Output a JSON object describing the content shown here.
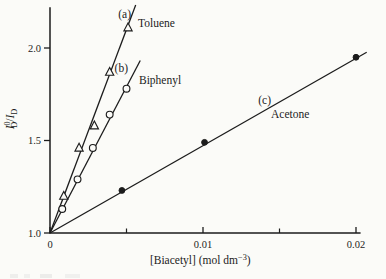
{
  "page": {
    "background": "#fbfbf8",
    "ink": "#1c1c1c"
  },
  "chart_data": {
    "type": "scatter",
    "title": "",
    "xlabel": "[Biacetyl] (mol dm⁻³)",
    "ylabel": "I⁰D/ID",
    "xlabel_parts": [
      {
        "t": "[Biacetyl] (mol dm"
      },
      {
        "t": "−3",
        "pos": "sup"
      },
      {
        "t": ")"
      }
    ],
    "ylabel_parts": [
      {
        "t": "I",
        "italic": true
      },
      {
        "t": "0",
        "pos": "sup"
      },
      {
        "t": "D",
        "pos": "sub",
        "stack": true
      },
      {
        "t": "/"
      },
      {
        "t": "I",
        "italic": true
      },
      {
        "t": "D",
        "pos": "sub"
      }
    ],
    "x_axis": {
      "range": [
        0,
        0.0203
      ],
      "major_ticks": [
        {
          "v": 0,
          "label": "0"
        },
        {
          "v": 0.01,
          "label": "0.01"
        },
        {
          "v": 0.02,
          "label": "0.02"
        }
      ],
      "minor_ticks": [
        0.005,
        0.015
      ]
    },
    "y_axis": {
      "range": [
        1.0,
        2.22
      ],
      "major_ticks": [
        {
          "v": 1.0,
          "label": "1.0"
        },
        {
          "v": 1.5,
          "label": "1.5"
        },
        {
          "v": 2.0,
          "label": "2.0"
        }
      ]
    },
    "grid": false,
    "legend": "inline-labels",
    "series": [
      {
        "tag": "(a)",
        "name": "Toluene",
        "marker": "triangle-open",
        "points": [
          [
            0.0009,
            1.2
          ],
          [
            0.0019,
            1.46
          ],
          [
            0.0029,
            1.58
          ],
          [
            0.0039,
            1.87
          ],
          [
            0.0051,
            2.11
          ]
        ],
        "fit_line": {
          "intercept": 1.0,
          "slope": 220,
          "x_end": 0.0056
        },
        "label_anchor_px": {
          "tag": [
            131,
            18
          ],
          "name": [
            138,
            27
          ]
        }
      },
      {
        "tag": "(b)",
        "name": "Biphenyl",
        "marker": "circle-open",
        "points": [
          [
            0.0008,
            1.13
          ],
          [
            0.0018,
            1.29
          ],
          [
            0.0028,
            1.46
          ],
          [
            0.0039,
            1.64
          ],
          [
            0.005,
            1.78
          ]
        ],
        "fit_line": {
          "intercept": 1.0,
          "slope": 158,
          "x_end": 0.0059
        },
        "label_anchor_px": {
          "tag": [
            128,
            72
          ],
          "name": [
            139,
            84
          ]
        }
      },
      {
        "tag": "(c)",
        "name": "Acetone",
        "marker": "circle-filled",
        "points": [
          [
            0.0047,
            1.23
          ],
          [
            0.0101,
            1.49
          ],
          [
            0.02,
            1.95
          ]
        ],
        "fit_line": {
          "intercept": 1.0,
          "slope": 47.2,
          "x_end": 0.0207
        },
        "label_anchor_px": {
          "tag": [
            271,
            104
          ],
          "name": [
            271,
            118
          ]
        }
      }
    ],
    "plot_px": {
      "x0": 50,
      "y0": 233,
      "px_per_x_unit": 15300,
      "px_per_y_unit": 185
    }
  }
}
